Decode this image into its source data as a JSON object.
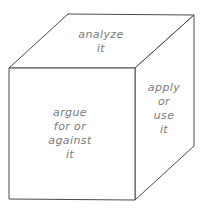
{
  "diagram": {
    "type": "cube",
    "colors": {
      "edge": "#4a4a4a",
      "text": "#7a7a7a",
      "background": "#ffffff"
    },
    "faces": {
      "top": {
        "lines": [
          "analyze",
          "it"
        ]
      },
      "front": {
        "lines": [
          "argue",
          "for or",
          "against",
          "it"
        ]
      },
      "right": {
        "lines": [
          "apply",
          "or",
          "use",
          "it"
        ]
      }
    }
  }
}
